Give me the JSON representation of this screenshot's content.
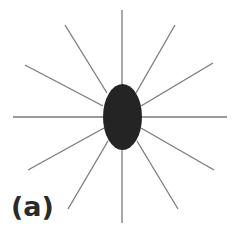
{
  "figure": {
    "label": "(a)",
    "colors": {
      "body": "#242424",
      "lines": "#7a7a7a",
      "background": "#ffffff"
    },
    "body": {
      "shape": "ellipse",
      "cx": 122.5,
      "cy": 117,
      "rx": 19.5,
      "ry": 33
    },
    "rays": [
      {
        "x1": 122,
        "y1": 84,
        "x2": 122,
        "y2": 10
      },
      {
        "x1": 136,
        "y1": 93,
        "x2": 175,
        "y2": 25
      },
      {
        "x1": 141,
        "y1": 106,
        "x2": 213,
        "y2": 63
      },
      {
        "x1": 142,
        "y1": 117,
        "x2": 227,
        "y2": 117
      },
      {
        "x1": 141,
        "y1": 128,
        "x2": 214,
        "y2": 170
      },
      {
        "x1": 137,
        "y1": 141,
        "x2": 178,
        "y2": 209
      },
      {
        "x1": 122,
        "y1": 150,
        "x2": 122,
        "y2": 223
      },
      {
        "x1": 108,
        "y1": 141,
        "x2": 68,
        "y2": 209
      },
      {
        "x1": 104,
        "y1": 128,
        "x2": 28,
        "y2": 170
      },
      {
        "x1": 103,
        "y1": 117,
        "x2": 13,
        "y2": 117
      },
      {
        "x1": 103,
        "y1": 106,
        "x2": 25,
        "y2": 65
      },
      {
        "x1": 107,
        "y1": 93,
        "x2": 65,
        "y2": 25
      }
    ]
  }
}
